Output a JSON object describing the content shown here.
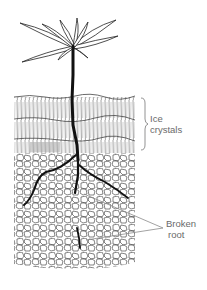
{
  "figure": {
    "labels": {
      "ice_crystals": {
        "line1": "Ice",
        "line2": "crystals"
      },
      "broken_root": {
        "line1": "Broken",
        "line2": "root"
      }
    },
    "colors": {
      "ink": "#1a1a1a",
      "label_text": "#6a6a6a",
      "pointer_line": "#8a8a8a",
      "background": "#ffffff"
    }
  }
}
